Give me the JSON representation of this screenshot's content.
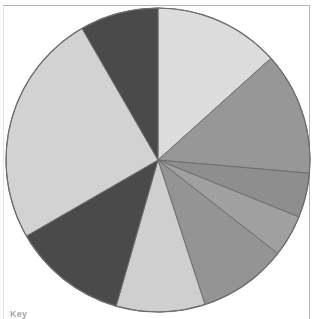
{
  "figure": {
    "type": "pie-chart-figure",
    "background_color": "#ffffff",
    "border_color": "#b5b5b5",
    "key_label": "Key",
    "key_visible_partial": true
  },
  "chart_data": {
    "type": "pie",
    "title": "",
    "subtitle": "",
    "xlabel": "",
    "ylabel": "",
    "legend_position": "below",
    "grid": false,
    "center_x": 158,
    "center_y": 160,
    "radius": 152,
    "start_angle_deg": 0,
    "direction": "clockwise",
    "outline_color": "#6e6e6e",
    "outline_width": 1,
    "categories": [
      "Segment 1",
      "Segment 2",
      "Segment 3",
      "Segment 4",
      "Segment 5",
      "Segment 6",
      "Segment 7",
      "Segment 8",
      "Segment 9"
    ],
    "values": [
      13.3,
      13.1,
      4.7,
      4.4,
      9.5,
      9.4,
      12.2,
      25.0,
      8.4
    ],
    "angles_deg": [
      48,
      47,
      17,
      16,
      34,
      34,
      44,
      90,
      30
    ],
    "colors": [
      "#dcdcdc",
      "#979797",
      "#8e8e8e",
      "#a0a0a0",
      "#949494",
      "#cfcfcf",
      "#4a4a4a",
      "#d2d2d2",
      "#4a4a4a"
    ],
    "labels_shown": false,
    "total_degrees": 360
  }
}
